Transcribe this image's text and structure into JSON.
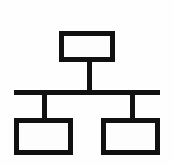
{
  "diagram": {
    "type": "org-chart-icon",
    "canvas": {
      "width": 173,
      "height": 165,
      "background_color": "#fefefe"
    },
    "style": {
      "stroke_color": "#111111",
      "stroke_width": 5,
      "node_fill": "#fdfdfd",
      "corner_radius": 0
    },
    "nodes": [
      {
        "id": "root",
        "label": "",
        "role": "parent-node",
        "x": 59,
        "y": 31,
        "width": 56,
        "height": 31
      },
      {
        "id": "child-left",
        "label": "",
        "role": "child-node-left",
        "x": 14,
        "y": 118,
        "width": 59,
        "height": 37
      },
      {
        "id": "child-right",
        "label": "",
        "role": "child-node-right",
        "x": 101,
        "y": 118,
        "width": 59,
        "height": 37
      }
    ],
    "connectors": [
      {
        "id": "root-stem",
        "role": "vertical-drop-from-root",
        "x1": 87,
        "y1": 62,
        "x2": 87,
        "y2": 90
      },
      {
        "id": "bus",
        "role": "horizontal-bus",
        "x1": 14,
        "y1": 90,
        "x2": 160,
        "y2": 90
      },
      {
        "id": "left-stem",
        "role": "vertical-drop-to-left-child",
        "x1": 42,
        "y1": 90,
        "x2": 42,
        "y2": 119
      },
      {
        "id": "right-stem",
        "role": "vertical-drop-to-right-child",
        "x1": 130,
        "y1": 90,
        "x2": 130,
        "y2": 119
      }
    ]
  }
}
